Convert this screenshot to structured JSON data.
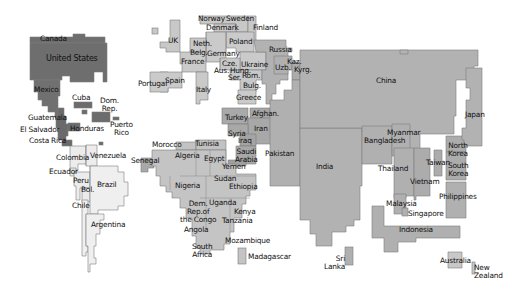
{
  "map": {
    "type": "population cartogram",
    "colors": {
      "americas_north": "#6f6f6f",
      "americas_south": "#ececec",
      "europe": "#c8c8c8",
      "africa": "#c2c2c2",
      "middle_east": "#a8a8a8",
      "asia": "#b0b0b0",
      "oceania": "#c8c8c8",
      "border": "#7a7a7a",
      "background": "#ffffff"
    },
    "labels": {
      "canada": "Canada",
      "united_states": "United States",
      "mexico": "Mexico",
      "cuba": "Cuba",
      "dom_rep": "Dom.\nRep.",
      "guatemala": "Guatemala",
      "el_salvador": "El Salvador",
      "honduras": "Honduras",
      "puerto_rico": "Puerto\nRico",
      "costa_rica": "Costa Rica",
      "colombia": "Colombia",
      "venezuela": "Venezuela",
      "ecuador": "Ecuador",
      "peru": "Peru",
      "bolivia": "Bol.",
      "brazil": "Brazil",
      "chile": "Chile",
      "argentina": "Argentina",
      "uk": "UK",
      "norway": "Norway",
      "sweden": "Sweden",
      "denmark": "Denmark",
      "finland": "Finland",
      "netherlands": "Neth.",
      "belgium": "Belg.",
      "germany": "Germany",
      "poland": "Poland",
      "france": "France",
      "czech": "Cze.",
      "austria": "Aus.",
      "hungary": "Hung.",
      "ukraine": "Ukraine",
      "serbia": "Ser.",
      "romania": "Rom.",
      "bulgaria": "Bulg.",
      "portugal": "Portugal",
      "spain": "Spain",
      "italy": "Italy",
      "greece": "Greece",
      "russia": "Russia",
      "kazakhstan": "Kaz.",
      "uzbekistan": "Uzb.",
      "kyrgyzstan": "Kyrg.",
      "afghanistan": "Afghan.",
      "turkey": "Turkey",
      "iran": "Iran",
      "syria": "Syria",
      "iraq": "Iraq",
      "saudi_arabia": "Saudi\nArabia",
      "yemen": "Yemen",
      "pakistan": "Pakistan",
      "india": "India",
      "sri_lanka": "Sri\nLanka",
      "china": "China",
      "japan": "Japan",
      "north_korea": "North\nKorea",
      "south_korea": "South\nKorea",
      "taiwan": "Taiwan",
      "myanmar": "Myanmar",
      "bangladesh": "Bangladesh",
      "thailand": "Thailand",
      "vietnam": "Vietnam",
      "philippines": "Philippines",
      "malaysia": "Malaysia",
      "singapore": "Singapore",
      "indonesia": "Indonesia",
      "australia": "Australia",
      "new_zealand": "New\nZealand",
      "morocco": "Morocco",
      "tunisia": "Tunisia",
      "algeria": "Algeria",
      "egypt": "Egypt",
      "senegal": "Senegal",
      "nigeria": "Nigeria",
      "sudan": "Sudan",
      "ethiopia": "Ethiopia",
      "drc": "Dem.\nRep.of\nthe Congo",
      "uganda": "Uganda",
      "kenya": "Kenya",
      "tanzania": "Tanzania",
      "angola": "Angola",
      "mozambique": "Mozambique",
      "south_africa": "South\nAfrica",
      "madagascar": "Madagascar"
    }
  }
}
